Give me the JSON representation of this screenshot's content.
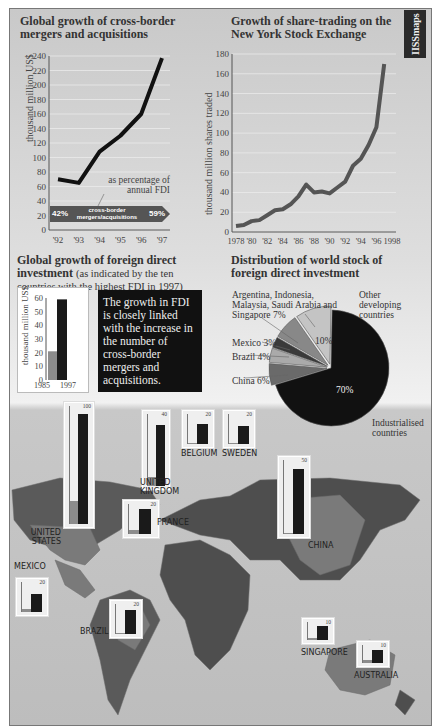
{
  "brand": "IISSmaps",
  "chart_data": [
    {
      "type": "line",
      "title": "Global growth of cross-border mergers and acquisitions",
      "xlabel": "",
      "ylabel": "thousand million US$",
      "categories": [
        "'92",
        "'93",
        "'94",
        "'95",
        "'96",
        "'97"
      ],
      "values": [
        70,
        65,
        108,
        130,
        160,
        237
      ],
      "ylim": [
        0,
        240
      ],
      "yticks": [
        0,
        20,
        40,
        60,
        80,
        100,
        120,
        140,
        160,
        180,
        200,
        220,
        240
      ],
      "grid": true,
      "annotation": {
        "label": "as percentage of annual FDI",
        "arrow_label": "cross-border mergers/acquisitions",
        "start": "42%",
        "end": "59%"
      }
    },
    {
      "type": "line",
      "title": "Growth of share-trading on the New York Stock Exchange",
      "xlabel": "",
      "ylabel": "thousand million shares traded",
      "x": [
        1978,
        1979,
        1980,
        1981,
        1982,
        1983,
        1984,
        1985,
        1986,
        1987,
        1988,
        1989,
        1990,
        1991,
        1992,
        1993,
        1994,
        1995,
        1996,
        1997
      ],
      "values": [
        6,
        7,
        11,
        12,
        17,
        22,
        23,
        28,
        36,
        48,
        40,
        41,
        39,
        45,
        51,
        67,
        74,
        88,
        106,
        170
      ],
      "xticks": [
        "1978",
        "'80",
        "'82",
        "'84",
        "'86",
        "'88",
        "'90",
        "'92",
        "'94",
        "'96",
        "1998"
      ],
      "yticks": [
        0,
        20,
        40,
        60,
        80,
        100,
        120,
        140,
        160,
        180
      ],
      "ylim": [
        0,
        180
      ],
      "grid": true
    },
    {
      "type": "bar",
      "title": "Global growth of foreign direct investment",
      "subtitle": "(as indicated by the ten countries with the highest FDI in 1997)",
      "ylabel": "thousand million US$",
      "categories": [
        "1985",
        "1997"
      ],
      "values": [
        21,
        59
      ],
      "ylim": [
        0,
        60
      ],
      "yticks": [
        0,
        10,
        20,
        30,
        40,
        50,
        60
      ]
    },
    {
      "type": "pie",
      "title": "Distribution of world stock of foreign direct investment",
      "labels": [
        "Industrialised countries",
        "China",
        "Brazil",
        "Mexico",
        "Argentina, Indonesia, Malaysia, Saudi Arabia and Singapore",
        "Other developing countries"
      ],
      "values": [
        70,
        6,
        4,
        3,
        7,
        10
      ]
    },
    {
      "type": "bar",
      "title": "FDI by country, 1985 vs 1997 (map insets)",
      "series": [
        {
          "name": "United States",
          "scale_max": 100,
          "values": [
            20,
            95
          ]
        },
        {
          "name": "United Kingdom",
          "scale_max": 40,
          "values": [
            5,
            35
          ]
        },
        {
          "name": "Belgium",
          "scale_max": 20,
          "values": [
            1,
            14
          ]
        },
        {
          "name": "Sweden",
          "scale_max": 20,
          "values": [
            1,
            13
          ]
        },
        {
          "name": "France",
          "scale_max": 20,
          "values": [
            3,
            18
          ]
        },
        {
          "name": "China",
          "scale_max": 50,
          "values": [
            1,
            45
          ]
        },
        {
          "name": "Mexico",
          "scale_max": 20,
          "values": [
            2,
            13
          ]
        },
        {
          "name": "Brazil",
          "scale_max": 20,
          "values": [
            1,
            17
          ]
        },
        {
          "name": "Singapore",
          "scale_max": 10,
          "values": [
            1,
            9
          ]
        },
        {
          "name": "Australia",
          "scale_max": 10,
          "values": [
            2,
            8
          ]
        }
      ]
    }
  ],
  "charts": {
    "ma": {
      "title": "Global growth of cross-border mergers and acquisitions",
      "ylabel": "thousand million US$",
      "note": "as percentage of annual FDI",
      "arrow": "cross-border mergers/acquisitions",
      "start": "42%",
      "end": "59%"
    },
    "nyse": {
      "title": "Growth of share-trading on the New York Stock Exchange",
      "ylabel": "thousand million shares traded"
    },
    "fdi": {
      "title": "Global growth of foreign direct investment",
      "subtitle": "(as indicated by the ten countries with the highest FDI in 1997)",
      "ylabel": "thousand million US$",
      "x1": "1985",
      "x2": "1997"
    },
    "note": "The growth in FDI is closely linked with the increase in the number of cross-border mergers and acquisitions.",
    "pie": {
      "title": "Distribution of world stock of foreign direct investment",
      "l_asia": "Argentina, Indonesia, Malaysia, Saudi Arabia and Singapore 7%",
      "l_other": "Other developing countries",
      "l_mexico": "Mexico 3%",
      "l_brazil": "Brazil 4%",
      "l_china": "China 6%",
      "l_ind": "Industrialised countries",
      "p_other": "10%",
      "p_ind": "70%"
    }
  },
  "map": {
    "countries": [
      "UNITED STATES",
      "UNITED KINGDOM",
      "BELGIUM",
      "SWEDEN",
      "FRANCE",
      "CHINA",
      "MEXICO",
      "BRAZIL",
      "SINGAPORE",
      "AUSTRALIA"
    ],
    "scales": [
      "100",
      "40",
      "20",
      "20",
      "20",
      "50",
      "20",
      "20",
      "10",
      "10"
    ]
  },
  "colors": {
    "dark": "#1a1a1a",
    "light": "#8c8c8c",
    "bg": "#c9c9c9",
    "land": "#4e4e4e"
  }
}
